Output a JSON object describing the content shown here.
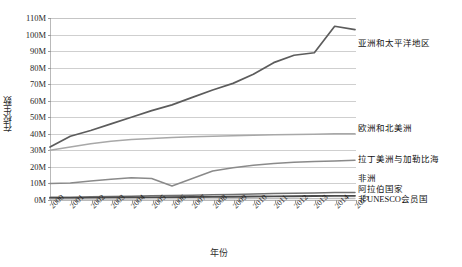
{
  "chart_data": {
    "type": "line",
    "title": "",
    "xlabel": "年份",
    "ylabel": "在校生数",
    "x": [
      2000,
      2001,
      2002,
      2003,
      2004,
      2005,
      2006,
      2007,
      2008,
      2009,
      2010,
      2011,
      2012,
      2013,
      2014,
      2015
    ],
    "xtick_labels": [
      "2000",
      "2001",
      "2002",
      "2003",
      "2004",
      "2005",
      "2006",
      "2007",
      "2008",
      "2009",
      "2010",
      "2011",
      "2012",
      "2013",
      "2014",
      "2015"
    ],
    "ylim": [
      0,
      110
    ],
    "ytick_values": [
      0,
      10,
      20,
      30,
      40,
      50,
      60,
      70,
      80,
      90,
      100,
      110
    ],
    "ytick_labels": [
      "0M",
      "10M",
      "20M",
      "30M",
      "40M",
      "50M",
      "60M",
      "70M",
      "80M",
      "90M",
      "100M",
      "110M"
    ],
    "y_unit": "M",
    "grid": true,
    "legend_position": "right-inline-labels",
    "series": [
      {
        "name": "亚洲和太平洋地区",
        "color": "#5c5c5c",
        "width": 1.7,
        "label_y_value": 95,
        "values": [
          32.0,
          38.5,
          42.0,
          46.0,
          50.0,
          54.0,
          57.5,
          62.0,
          66.5,
          70.5,
          76.0,
          83.0,
          87.5,
          89.0,
          105.0,
          103.0
        ]
      },
      {
        "name": "欧洲和北美洲",
        "color": "#a8a8a8",
        "width": 1.5,
        "label_y_value": 43.5,
        "values": [
          30.0,
          32.0,
          34.0,
          35.5,
          36.5,
          37.2,
          37.8,
          38.2,
          38.6,
          38.9,
          39.2,
          39.4,
          39.6,
          39.8,
          40.0,
          40.0
        ]
      },
      {
        "name": "拉丁美洲与加勒比海",
        "color": "#8a8a8a",
        "width": 1.5,
        "label_y_value": 25.0,
        "values": [
          10.0,
          10.2,
          11.5,
          12.5,
          13.5,
          13.0,
          8.5,
          13.0,
          17.5,
          19.5,
          21.0,
          22.0,
          22.8,
          23.2,
          23.6,
          24.0
        ]
      },
      {
        "name": "非洲",
        "color": "#707070",
        "width": 1.5,
        "label_y_value": 13.0,
        "values": [
          1.6,
          1.7,
          1.9,
          2.1,
          2.3,
          2.5,
          2.7,
          2.9,
          3.1,
          3.3,
          3.6,
          3.9,
          4.1,
          4.3,
          4.5,
          4.6
        ]
      },
      {
        "name": "阿拉伯国家",
        "color": "#4a4a4a",
        "width": 1.9,
        "label_y_value": 6.5,
        "values": [
          1.2,
          1.25,
          1.3,
          1.4,
          1.5,
          1.6,
          1.7,
          1.8,
          1.9,
          2.0,
          2.1,
          2.2,
          2.3,
          2.4,
          2.5,
          2.5
        ]
      },
      {
        "name": "非UNESCO会员国",
        "color": "#bdbdbd",
        "width": 1.3,
        "label_y_value": 0.6,
        "values": [
          0.5,
          0.5,
          0.55,
          0.6,
          0.6,
          0.65,
          0.65,
          0.7,
          0.7,
          0.75,
          0.8,
          0.8,
          0.85,
          0.85,
          0.9,
          0.9
        ]
      }
    ],
    "caption": ""
  }
}
